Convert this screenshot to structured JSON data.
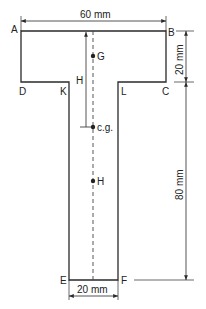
{
  "diagram": {
    "type": "T-section cross-section",
    "colors": {
      "line": "#2a2a2a",
      "background": "#ffffff"
    },
    "vertices": {
      "A": "A",
      "B": "B",
      "C": "C",
      "D": "D",
      "K": "K",
      "L": "L",
      "E": "E",
      "F": "F"
    },
    "points": {
      "G": "G",
      "cg": "c.g.",
      "H": "H"
    },
    "distance_label": "H",
    "dimensions": {
      "flange_width": "60 mm",
      "flange_depth": "20 mm",
      "web_height": "80 mm",
      "web_width": "20 mm"
    }
  }
}
